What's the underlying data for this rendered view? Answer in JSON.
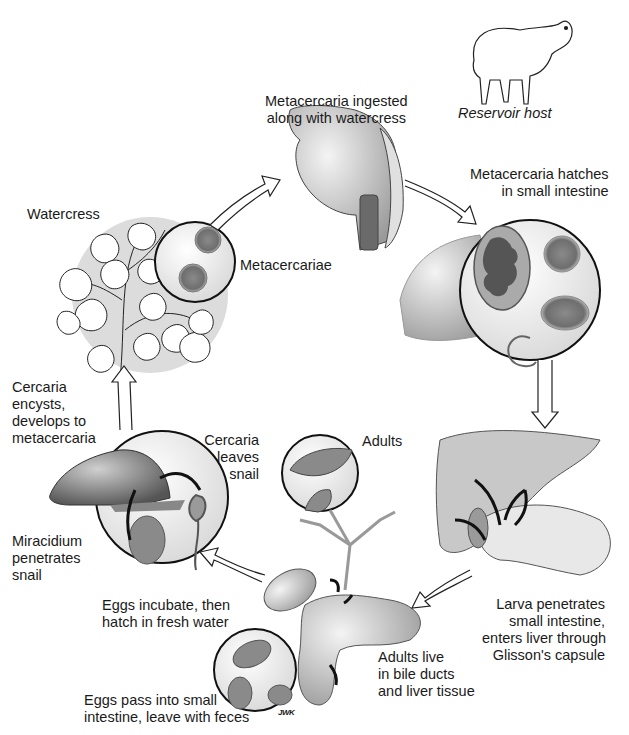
{
  "diagram": {
    "type": "life-cycle",
    "stages": [
      {
        "id": "ingested",
        "lines": [
          "Metacercaria ingested",
          "along with watercress"
        ]
      },
      {
        "id": "reservoir",
        "lines": [
          "Reservoir host"
        ]
      },
      {
        "id": "hatches",
        "lines": [
          "Metacercaria hatches",
          "in small intestine"
        ]
      },
      {
        "id": "watercress",
        "lines": [
          "Watercress"
        ]
      },
      {
        "id": "metacercariae",
        "lines": [
          "Metacercariae"
        ]
      },
      {
        "id": "encysts",
        "lines": [
          "Cercaria",
          "encysts,",
          "develops to",
          "metacercaria"
        ]
      },
      {
        "id": "leaves-snail",
        "lines": [
          "Cercaria",
          "leaves",
          "snail"
        ]
      },
      {
        "id": "adults",
        "lines": [
          "Adults"
        ]
      },
      {
        "id": "miracidium",
        "lines": [
          "Miracidium",
          "penetrates",
          "snail"
        ]
      },
      {
        "id": "incubate",
        "lines": [
          "Eggs incubate, then",
          "hatch in fresh water"
        ]
      },
      {
        "id": "larva",
        "lines": [
          "Larva penetrates",
          "small intestine,",
          "enters liver through",
          "Glisson's capsule"
        ]
      },
      {
        "id": "adults-live",
        "lines": [
          "Adults live",
          "in bile ducts",
          "and liver tissue"
        ]
      },
      {
        "id": "eggs-pass",
        "lines": [
          "Eggs pass into small",
          "intestine, leave with feces"
        ]
      }
    ],
    "signature": "JWK",
    "colors": {
      "ink": "#1a1a1a",
      "fill_light": "#ececec",
      "fill_mid": "#bdbdbd",
      "fill_dark": "#7a7a7a",
      "halo": "#dcdcdc"
    }
  }
}
